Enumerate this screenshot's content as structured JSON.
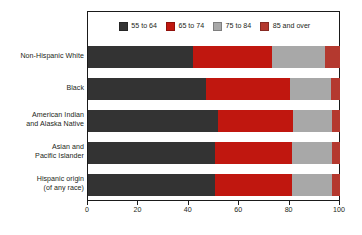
{
  "chart_data": {
    "type": "bar",
    "orientation": "horizontal",
    "stacked": true,
    "stack_mode": "percent",
    "title": "",
    "subtitle": "",
    "xlabel": "",
    "ylabel": "",
    "xlim": [
      0,
      100
    ],
    "xticks": [
      0,
      20,
      40,
      60,
      80,
      100
    ],
    "xtick_labels": [
      "0",
      "20",
      "40",
      "60",
      "80",
      "100"
    ],
    "grid": false,
    "legend_position": "top-center",
    "categories": [
      "Non-Hispanic White",
      "Black",
      "American Indian and Alaska Native",
      "Asian and Pacific Islander",
      "Hispanic origin (of any race)"
    ],
    "category_lines": [
      [
        "Non-Hispanic White"
      ],
      [
        "Black"
      ],
      [
        "American Indian",
        "and Alaska Native"
      ],
      [
        "Asian and",
        "Pacific Islander"
      ],
      [
        "Hispanic origin",
        "(of any race)"
      ]
    ],
    "series": [
      {
        "name": "55 to 64",
        "color": "#333333",
        "values": [
          41.5,
          47.0,
          51.5,
          50.5,
          50.5
        ]
      },
      {
        "name": "65 to 74",
        "color": "#c0170f",
        "values": [
          31.5,
          33.0,
          30.0,
          30.5,
          30.5
        ]
      },
      {
        "name": "75 to 84",
        "color": "#a8a8a8",
        "values": [
          21.0,
          16.5,
          15.5,
          16.0,
          16.0
        ]
      },
      {
        "name": "85 and over",
        "color": "#b4392f",
        "values": [
          6.0,
          3.5,
          3.0,
          3.0,
          3.0
        ]
      }
    ]
  },
  "legend": {
    "items": [
      {
        "label": "55 to 64",
        "color": "#333333"
      },
      {
        "label": "65 to 74",
        "color": "#c0170f"
      },
      {
        "label": "75 to 84",
        "color": "#a8a8a8"
      },
      {
        "label": "85 and over",
        "color": "#b4392f"
      }
    ]
  },
  "colors": {
    "axis": "#1a1a1a",
    "text": "#231f20",
    "background": "#ffffff"
  }
}
